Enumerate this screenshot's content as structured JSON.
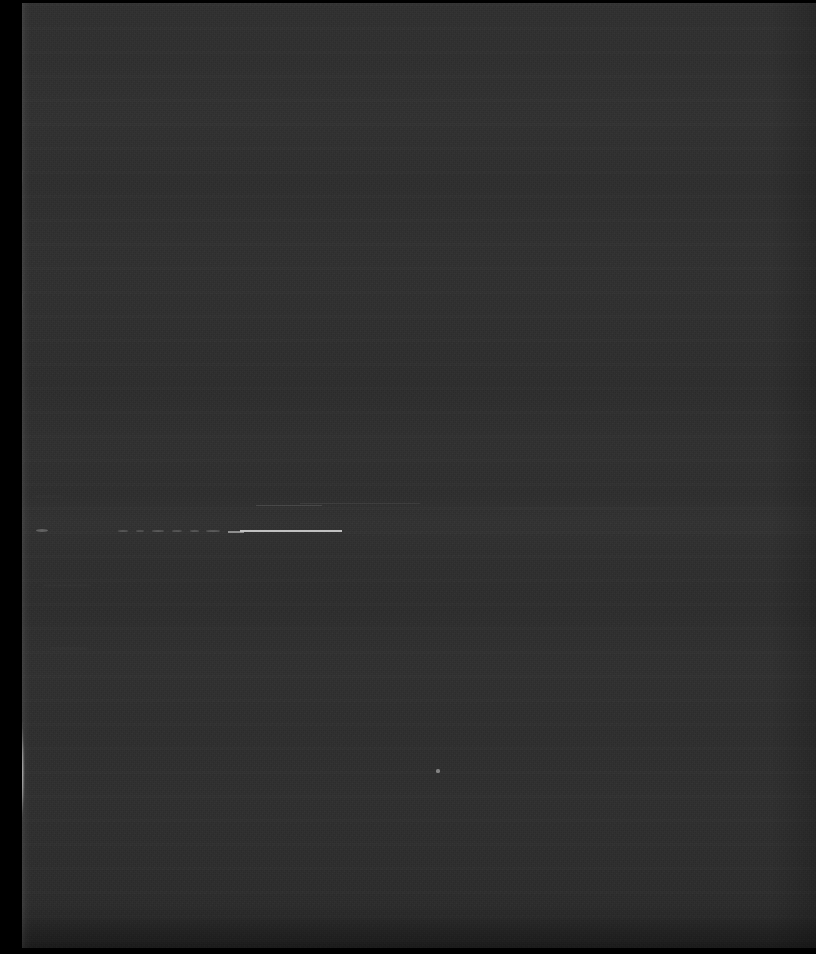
{
  "image": {
    "kind": "underexposed-document-photograph",
    "width": 816,
    "height": 954,
    "overall_description": "Severely underexposed photograph of a dark page with a torn left edge; almost entirely near-black with faint horizontal banding and a few bright scratch-like marks.",
    "visible_text": "",
    "legibility_note": "No legible text is rendered in the pixels."
  },
  "colors": {
    "border_black": "#000000",
    "page_base": "#2f2f2f",
    "page_band_light": "#323232",
    "page_band_dark": "#242424",
    "torn_edge_highlight": "#d8d8d8",
    "mark_bright": "#c9c9c9"
  },
  "regions": {
    "black_left_margin": {
      "x": 0,
      "y": 0,
      "width": 22,
      "height": 954
    },
    "black_top_border": {
      "x": 0,
      "y": 0,
      "width": 816,
      "height": 3
    },
    "black_bottom_border": {
      "x": 0,
      "y": 951,
      "width": 816,
      "height": 3
    },
    "page_surface": {
      "x": 22,
      "y": 3,
      "width": 794,
      "height": 945
    },
    "torn_page_edge": {
      "x": 22,
      "y": 3,
      "width": 13,
      "height": 945
    }
  },
  "edge_blobs": [
    {
      "name": "torn-highlight-upper",
      "x": 8,
      "y": 160,
      "width": 13,
      "height": 32,
      "radius": "40% 55% 50% 45%",
      "opacity": 0.85
    },
    {
      "name": "torn-highlight-upper2",
      "x": 10,
      "y": 192,
      "width": 9,
      "height": 14,
      "radius": "50%",
      "opacity": 0.55
    },
    {
      "name": "torn-highlight-mid",
      "x": 9,
      "y": 283,
      "width": 12,
      "height": 38,
      "radius": "45% 50% 55% 40%",
      "opacity": 0.8
    },
    {
      "name": "torn-highlight-lower",
      "x": 7,
      "y": 700,
      "width": 16,
      "height": 130,
      "radius": "35% 60% 45% 50%",
      "opacity": 0.95
    },
    {
      "name": "torn-highlight-tail",
      "x": 11,
      "y": 826,
      "width": 8,
      "height": 22,
      "radius": "50%",
      "opacity": 0.45
    }
  ],
  "marks": [
    {
      "name": "bright-stroke-main",
      "type": "line",
      "x": 240,
      "y": 530,
      "width": 102,
      "height": 2,
      "opacity": 0.95
    },
    {
      "name": "bright-stroke-left",
      "type": "line",
      "x": 228,
      "y": 531,
      "width": 16,
      "height": 2,
      "opacity": 0.6
    },
    {
      "name": "faint-rule-upper",
      "type": "faint",
      "x": 256,
      "y": 505,
      "width": 66,
      "height": 1,
      "opacity": 0.55
    },
    {
      "name": "faint-rule-upper2",
      "type": "faint",
      "x": 300,
      "y": 503,
      "width": 120,
      "height": 1,
      "opacity": 0.3
    },
    {
      "name": "dash-1",
      "type": "dash",
      "x": 118,
      "y": 530,
      "width": 10,
      "height": 2,
      "opacity": 0.4
    },
    {
      "name": "dash-2",
      "type": "dash",
      "x": 136,
      "y": 530,
      "width": 8,
      "height": 2,
      "opacity": 0.35
    },
    {
      "name": "dash-3",
      "type": "dash",
      "x": 152,
      "y": 530,
      "width": 12,
      "height": 2,
      "opacity": 0.42
    },
    {
      "name": "dash-4",
      "type": "dash",
      "x": 172,
      "y": 530,
      "width": 10,
      "height": 2,
      "opacity": 0.38
    },
    {
      "name": "dash-5",
      "type": "dash",
      "x": 190,
      "y": 530,
      "width": 9,
      "height": 2,
      "opacity": 0.4
    },
    {
      "name": "dash-6",
      "type": "dash",
      "x": 206,
      "y": 530,
      "width": 14,
      "height": 2,
      "opacity": 0.45
    },
    {
      "name": "dash-edge-left",
      "type": "dash",
      "x": 36,
      "y": 529,
      "width": 12,
      "height": 3,
      "opacity": 0.55
    },
    {
      "name": "speck-mid-lower",
      "type": "speck",
      "x": 436,
      "y": 769,
      "width": 4,
      "height": 4,
      "opacity": 0.7
    },
    {
      "name": "scratch-left-a",
      "type": "scratch",
      "x": 44,
      "y": 585,
      "width": 46,
      "height": 1,
      "opacity": 0.45
    },
    {
      "name": "scratch-left-b",
      "type": "scratch",
      "x": 50,
      "y": 648,
      "width": 38,
      "height": 1,
      "opacity": 0.4
    },
    {
      "name": "scratch-left-c",
      "type": "scratch",
      "x": 34,
      "y": 496,
      "width": 28,
      "height": 1,
      "opacity": 0.35
    },
    {
      "name": "scratch-right-a",
      "type": "scratch",
      "x": 500,
      "y": 508,
      "width": 160,
      "height": 1,
      "opacity": 0.25
    }
  ]
}
